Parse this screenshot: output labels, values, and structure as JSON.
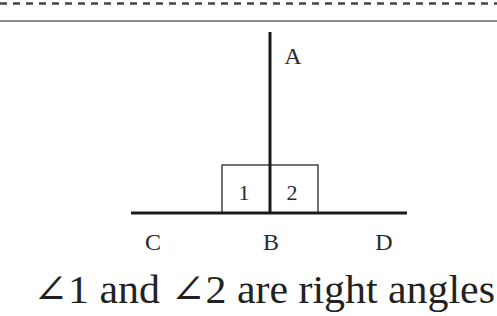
{
  "diagram": {
    "points": {
      "A": "A",
      "B": "B",
      "C": "C",
      "D": "D"
    },
    "angles": {
      "angle1": "1",
      "angle2": "2"
    },
    "caption": "∠1 and ∠2 are right angles"
  },
  "colors": {
    "line": "#1a1a1a",
    "dashed_border": "#444444",
    "top_rule": "#555555",
    "background": "#ffffff"
  }
}
